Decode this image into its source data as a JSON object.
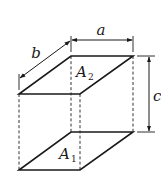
{
  "diagram": {
    "type": "rectangular-prism-dimensions",
    "labels": {
      "width": "a",
      "depth": "b",
      "height": "c",
      "top_face": "A",
      "top_face_sub": "2",
      "bottom_face": "A",
      "bottom_face_sub": "1"
    },
    "colors": {
      "line": "#1a1a1a",
      "background": "#ffffff"
    }
  }
}
